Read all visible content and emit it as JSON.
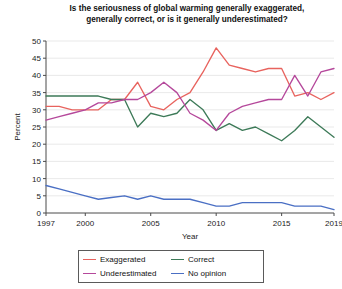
{
  "chart_data": {
    "type": "line",
    "title": "Is the seriousness of global warming generally exaggerated, generally correct, or is it generally underestimated?",
    "title_line1": "Is the seriousness of global warming generally exaggerated,",
    "title_line2": "generally correct, or is it generally underestimated?",
    "xlabel": "Year",
    "ylabel": "Percent",
    "xlim": [
      1997,
      2019
    ],
    "ylim": [
      0,
      50
    ],
    "grid": "horizontal",
    "legend_position": "bottom",
    "xticks": [
      "1997",
      "2000",
      "2005",
      "2010",
      "2015",
      "2019"
    ],
    "xtick_values": [
      1997,
      2000,
      2005,
      2010,
      2015,
      2019
    ],
    "yticks": [
      "0",
      "5",
      "10",
      "15",
      "20",
      "25",
      "30",
      "35",
      "40",
      "45",
      "50"
    ],
    "ytick_values": [
      0,
      5,
      10,
      15,
      20,
      25,
      30,
      35,
      40,
      45,
      50
    ],
    "x": [
      1997,
      1998,
      1999,
      2000,
      2001,
      2002,
      2003,
      2004,
      2005,
      2006,
      2007,
      2008,
      2009,
      2010,
      2011,
      2012,
      2013,
      2014,
      2015,
      2016,
      2017,
      2018,
      2019
    ],
    "series": [
      {
        "name": "Exaggerated",
        "color": "#e8635e",
        "values": [
          31,
          31,
          30,
          30,
          30,
          33,
          33,
          38,
          31,
          30,
          33,
          35,
          41,
          48,
          43,
          42,
          41,
          42,
          42,
          34,
          35,
          33,
          35
        ]
      },
      {
        "name": "Correct",
        "color": "#3d7a58",
        "values": [
          34,
          34,
          34,
          34,
          34,
          33,
          33,
          25,
          29,
          28,
          29,
          33,
          30,
          24,
          26,
          24,
          25,
          23,
          21,
          24,
          28,
          25,
          22
        ]
      },
      {
        "name": "Underestimated",
        "color": "#b5489b",
        "values": [
          27,
          28,
          29,
          30,
          32,
          32,
          33,
          33,
          35,
          38,
          35,
          29,
          27,
          24,
          29,
          31,
          32,
          33,
          33,
          40,
          34,
          41,
          42
        ]
      },
      {
        "name": "No opinion",
        "color": "#4a6fc4",
        "values": [
          8,
          7,
          6,
          5,
          4,
          4.5,
          5,
          4,
          5,
          4,
          4,
          4,
          3,
          2,
          2,
          3,
          3,
          3,
          3,
          2,
          2,
          2,
          1
        ]
      }
    ]
  },
  "legend": {
    "items": [
      {
        "label": "Exaggerated",
        "color": "#e8635e"
      },
      {
        "label": "Correct",
        "color": "#3d7a58"
      },
      {
        "label": "Underestimated",
        "color": "#b5489b"
      },
      {
        "label": "No opinion",
        "color": "#4a6fc4"
      }
    ]
  }
}
